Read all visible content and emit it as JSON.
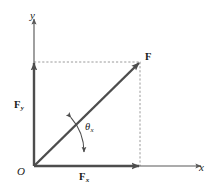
{
  "figure": {
    "kind": "vector-decomposition-diagram",
    "background_color": "#ffffff",
    "line_color": "#595959",
    "vector_color": "#4d4d4d",
    "dashed_color": "#9a9a9a",
    "text_color": "#1a1a1a"
  },
  "axes": {
    "y_label": "y",
    "x_label": "x",
    "origin_label": "O",
    "x_axis": {
      "from": [
        34,
        166
      ],
      "to": [
        202,
        166
      ]
    },
    "y_axis": {
      "from": [
        34,
        166
      ],
      "to": [
        34,
        18
      ]
    }
  },
  "vectors": {
    "resultant": {
      "label": "F",
      "from": [
        34,
        166
      ],
      "to": [
        140,
        62
      ]
    },
    "y_component": {
      "label": "F",
      "subscript": "y",
      "from": [
        34,
        166
      ],
      "to": [
        34,
        62
      ]
    },
    "x_component": {
      "label": "F",
      "subscript": "x",
      "from": [
        34,
        166
      ],
      "to": [
        140,
        166
      ]
    }
  },
  "angle": {
    "symbol": "θ",
    "subscript": "x",
    "vertex": [
      34,
      166
    ],
    "radius": 62,
    "between": [
      "x-axis",
      "F"
    ],
    "double_headed": true
  },
  "projection_lines": {
    "horizontal": {
      "from": [
        34,
        62
      ],
      "to": [
        140,
        62
      ],
      "style": "dashed"
    },
    "vertical": {
      "from": [
        140,
        62
      ],
      "to": [
        140,
        166
      ],
      "style": "dashed"
    }
  }
}
